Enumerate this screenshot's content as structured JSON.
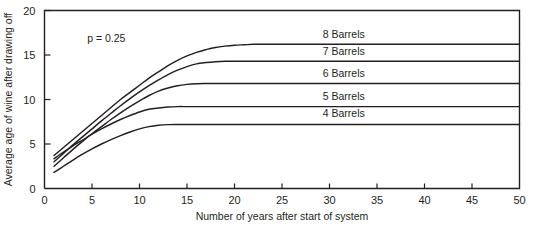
{
  "chart_data": {
    "type": "line",
    "title": "",
    "xlabel": "Number of years after start of system",
    "ylabel": "Average age of wine after drawing off",
    "xlim": [
      0,
      50
    ],
    "ylim": [
      0,
      20
    ],
    "xticks": [
      0,
      5,
      10,
      15,
      20,
      25,
      30,
      35,
      40,
      45,
      50
    ],
    "xtick_labels": [
      "0",
      "5",
      "10",
      "15",
      "20",
      "25",
      "30",
      "35",
      "40",
      "45",
      "50"
    ],
    "yticks": [
      0,
      5,
      10,
      15,
      20
    ],
    "ytick_labels": [
      "0",
      "5",
      "10",
      "15",
      "20"
    ],
    "grid": false,
    "legend_position": "inline-right-of-curves",
    "annotations": [
      {
        "text": "p = 0.25",
        "x": 6.5,
        "y": 16.5
      }
    ],
    "series": [
      {
        "name": "8 Barrels",
        "label": "8 Barrels",
        "label_x": 31.5,
        "label_y": 16.9,
        "plateau": 16.2,
        "x": [
          1,
          2,
          3,
          4,
          5,
          6,
          7,
          8,
          9,
          10,
          11,
          12,
          13,
          14,
          15,
          16,
          17,
          18,
          19,
          20,
          21,
          22,
          23,
          25,
          30,
          35,
          40,
          45,
          50
        ],
        "values": [
          3.7,
          4.6,
          5.5,
          6.4,
          7.3,
          8.2,
          9.1,
          10.0,
          10.8,
          11.6,
          12.4,
          13.1,
          13.8,
          14.4,
          14.9,
          15.3,
          15.6,
          15.85,
          16.0,
          16.1,
          16.15,
          16.2,
          16.2,
          16.2,
          16.2,
          16.2,
          16.2,
          16.2,
          16.2
        ]
      },
      {
        "name": "7 Barrels",
        "label": "7 Barrels",
        "label_x": 31.5,
        "label_y": 15.0,
        "plateau": 14.3,
        "x": [
          1,
          2,
          3,
          4,
          5,
          6,
          7,
          8,
          9,
          10,
          11,
          12,
          13,
          14,
          15,
          16,
          17,
          18,
          19,
          20,
          21,
          22,
          25,
          30,
          35,
          40,
          45,
          50
        ],
        "values": [
          3.0,
          3.95,
          4.9,
          5.8,
          6.7,
          7.6,
          8.45,
          9.3,
          10.1,
          10.85,
          11.55,
          12.2,
          12.8,
          13.3,
          13.7,
          14.0,
          14.15,
          14.25,
          14.3,
          14.3,
          14.3,
          14.3,
          14.3,
          14.3,
          14.3,
          14.3,
          14.3,
          14.3
        ]
      },
      {
        "name": "6 Barrels",
        "label": "6 Barrels",
        "label_x": 31.5,
        "label_y": 12.5,
        "plateau": 11.8,
        "x": [
          1,
          2,
          3,
          4,
          5,
          6,
          7,
          8,
          9,
          10,
          11,
          12,
          13,
          14,
          15,
          16,
          17,
          18,
          19,
          20,
          25,
          30,
          35,
          40,
          45,
          50
        ],
        "values": [
          2.5,
          3.45,
          4.4,
          5.3,
          6.15,
          6.95,
          7.75,
          8.5,
          9.2,
          9.85,
          10.45,
          10.95,
          11.3,
          11.55,
          11.7,
          11.78,
          11.8,
          11.8,
          11.8,
          11.8,
          11.8,
          11.8,
          11.8,
          11.8,
          11.8,
          11.8
        ]
      },
      {
        "name": "5 Barrels",
        "label": "5 Barrels",
        "label_x": 31.5,
        "label_y": 10.0,
        "plateau": 9.2,
        "x": [
          1,
          2,
          3,
          4,
          5,
          6,
          7,
          8,
          9,
          10,
          11,
          12,
          13,
          14,
          15,
          16,
          17,
          18,
          20,
          25,
          30,
          35,
          40,
          45,
          50
        ],
        "values": [
          3.35,
          4.1,
          4.8,
          5.45,
          6.1,
          6.7,
          7.25,
          7.75,
          8.2,
          8.6,
          8.9,
          9.05,
          9.15,
          9.2,
          9.2,
          9.2,
          9.2,
          9.2,
          9.2,
          9.2,
          9.2,
          9.2,
          9.2,
          9.2,
          9.2
        ]
      },
      {
        "name": "4 Barrels",
        "label": "4 Barrels",
        "label_x": 31.5,
        "label_y": 8.0,
        "plateau": 7.2,
        "x": [
          1,
          2,
          3,
          4,
          5,
          6,
          7,
          8,
          9,
          10,
          11,
          12,
          13,
          14,
          15,
          16,
          17,
          20,
          25,
          30,
          35,
          40,
          45,
          50
        ],
        "values": [
          1.8,
          2.5,
          3.2,
          3.85,
          4.45,
          5.0,
          5.5,
          5.95,
          6.35,
          6.7,
          6.95,
          7.1,
          7.18,
          7.2,
          7.2,
          7.2,
          7.2,
          7.2,
          7.2,
          7.2,
          7.2,
          7.2,
          7.2,
          7.2
        ]
      }
    ]
  },
  "colors": {
    "ink": "#231f20",
    "background": "#ffffff"
  }
}
